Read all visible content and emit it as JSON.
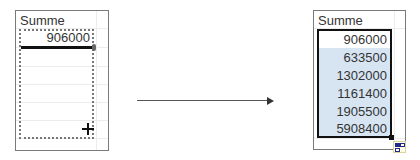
{
  "before": {
    "header": "Summe",
    "active_value": "906000"
  },
  "after": {
    "header": "Summe",
    "values": [
      "906000",
      "633500",
      "1302000",
      "1161400",
      "1905500",
      "5908400"
    ]
  },
  "arrow": {
    "direction": "right"
  },
  "colors": {
    "selection_fill": "#d7e5f3",
    "selection_border": "#111111",
    "autofill_icon": "#1f2a8c"
  }
}
